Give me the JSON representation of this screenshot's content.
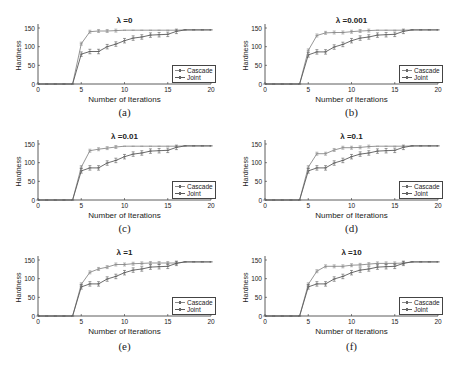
{
  "figure": {
    "panels": [
      {
        "id": "a",
        "title": "λ =0",
        "caption": "(a)"
      },
      {
        "id": "b",
        "title": "λ =0.001",
        "caption": "(b)"
      },
      {
        "id": "c",
        "title": "λ =0.01",
        "caption": "(c)"
      },
      {
        "id": "d",
        "title": "λ =0.1",
        "caption": "(d)"
      },
      {
        "id": "e",
        "title": "λ =1",
        "caption": "(e)"
      },
      {
        "id": "f",
        "title": "λ =10",
        "caption": "(f)"
      }
    ],
    "xlabel": "Number of Iterations",
    "ylabel": "Hardness",
    "legend": [
      "Cascade",
      "Joint"
    ],
    "xticks": [
      "0",
      "5",
      "10",
      "15",
      "20"
    ],
    "yticks": [
      "0",
      "50",
      "100",
      "150"
    ],
    "colors": {
      "cascade": "#8a8a8a",
      "joint": "#5a5a5a",
      "axis": "#333333"
    }
  },
  "chart_data": [
    {
      "type": "line",
      "title": "λ =0",
      "caption": "(a)",
      "xlabel": "Number of Iterations",
      "ylabel": "Hardness",
      "xlim": [
        0,
        20
      ],
      "ylim": [
        0,
        155
      ],
      "legend_position": "lower right",
      "grid": false,
      "x": [
        1,
        2,
        3,
        4,
        5,
        6,
        7,
        8,
        9,
        10,
        11,
        12,
        13,
        14,
        15,
        16,
        17,
        18,
        19,
        20
      ],
      "series": [
        {
          "name": "Cascade",
          "values": [
            0,
            0,
            0,
            0,
            108,
            140,
            142,
            142,
            143,
            144,
            144,
            144,
            144,
            144,
            144,
            144,
            145,
            145,
            145,
            145
          ]
        },
        {
          "name": "Joint",
          "values": [
            0,
            0,
            0,
            0,
            80,
            87,
            87,
            100,
            107,
            116,
            123,
            126,
            131,
            132,
            133,
            141,
            145,
            145,
            145,
            145
          ]
        }
      ]
    },
    {
      "type": "line",
      "title": "λ =0.001",
      "caption": "(b)",
      "xlabel": "Number of Iterations",
      "ylabel": "Hardness",
      "xlim": [
        0,
        20
      ],
      "ylim": [
        0,
        155
      ],
      "legend_position": "lower right",
      "grid": false,
      "x": [
        1,
        2,
        3,
        4,
        5,
        6,
        7,
        8,
        9,
        10,
        11,
        12,
        13,
        14,
        15,
        16,
        17,
        18,
        19,
        20
      ],
      "series": [
        {
          "name": "Cascade",
          "values": [
            0,
            0,
            0,
            0,
            90,
            130,
            137,
            138,
            138,
            140,
            142,
            143,
            144,
            144,
            144,
            144,
            145,
            145,
            145,
            145
          ]
        },
        {
          "name": "Joint",
          "values": [
            0,
            0,
            0,
            0,
            78,
            86,
            86,
            99,
            106,
            116,
            123,
            126,
            131,
            132,
            133,
            141,
            145,
            145,
            145,
            145
          ]
        }
      ]
    },
    {
      "type": "line",
      "title": "λ =0.01",
      "caption": "(c)",
      "xlabel": "Number of Iterations",
      "ylabel": "Hardness",
      "xlim": [
        0,
        20
      ],
      "ylim": [
        0,
        155
      ],
      "legend_position": "lower right",
      "grid": false,
      "x": [
        1,
        2,
        3,
        4,
        5,
        6,
        7,
        8,
        9,
        10,
        11,
        12,
        13,
        14,
        15,
        16,
        17,
        18,
        19,
        20
      ],
      "series": [
        {
          "name": "Cascade",
          "values": [
            0,
            0,
            0,
            0,
            88,
            132,
            136,
            139,
            142,
            144,
            144,
            144,
            144,
            144,
            144,
            144,
            145,
            145,
            145,
            145
          ]
        },
        {
          "name": "Joint",
          "values": [
            0,
            0,
            0,
            0,
            78,
            86,
            86,
            99,
            106,
            116,
            123,
            126,
            131,
            132,
            133,
            141,
            145,
            145,
            145,
            145
          ]
        }
      ]
    },
    {
      "type": "line",
      "title": "λ =0.1",
      "caption": "(d)",
      "xlabel": "Number of Iterations",
      "ylabel": "Hardness",
      "xlim": [
        0,
        20
      ],
      "ylim": [
        0,
        155
      ],
      "legend_position": "lower right",
      "grid": false,
      "x": [
        1,
        2,
        3,
        4,
        5,
        6,
        7,
        8,
        9,
        10,
        11,
        12,
        13,
        14,
        15,
        16,
        17,
        18,
        19,
        20
      ],
      "series": [
        {
          "name": "Cascade",
          "values": [
            0,
            0,
            0,
            0,
            88,
            124,
            124,
            134,
            140,
            140,
            141,
            143,
            144,
            144,
            144,
            144,
            145,
            145,
            145,
            145
          ]
        },
        {
          "name": "Joint",
          "values": [
            0,
            0,
            0,
            0,
            78,
            86,
            86,
            99,
            106,
            116,
            123,
            126,
            131,
            132,
            133,
            141,
            145,
            145,
            145,
            145
          ]
        }
      ]
    },
    {
      "type": "line",
      "title": "λ =1",
      "caption": "(e)",
      "xlabel": "Number of Iterations",
      "ylabel": "Hardness",
      "xlim": [
        0,
        20
      ],
      "ylim": [
        0,
        155
      ],
      "legend_position": "lower right",
      "grid": false,
      "x": [
        1,
        2,
        3,
        4,
        5,
        6,
        7,
        8,
        9,
        10,
        11,
        12,
        13,
        14,
        15,
        16,
        17,
        18,
        19,
        20
      ],
      "series": [
        {
          "name": "Cascade",
          "values": [
            0,
            0,
            0,
            0,
            85,
            117,
            126,
            131,
            138,
            138,
            140,
            141,
            142,
            142,
            142,
            142,
            145,
            145,
            145,
            145
          ]
        },
        {
          "name": "Joint",
          "values": [
            0,
            0,
            0,
            0,
            78,
            86,
            86,
            99,
            106,
            116,
            123,
            126,
            131,
            132,
            133,
            141,
            145,
            145,
            145,
            145
          ]
        }
      ]
    },
    {
      "type": "line",
      "title": "λ =10",
      "caption": "(f)",
      "xlabel": "Number of Iterations",
      "ylabel": "Hardness",
      "xlim": [
        0,
        20
      ],
      "ylim": [
        0,
        155
      ],
      "legend_position": "lower right",
      "grid": false,
      "x": [
        1,
        2,
        3,
        4,
        5,
        6,
        7,
        8,
        9,
        10,
        11,
        12,
        13,
        14,
        15,
        16,
        17,
        18,
        19,
        20
      ],
      "series": [
        {
          "name": "Cascade",
          "values": [
            0,
            0,
            0,
            0,
            85,
            120,
            133,
            133,
            133,
            136,
            137,
            139,
            141,
            141,
            141,
            142,
            145,
            145,
            145,
            145
          ]
        },
        {
          "name": "Joint",
          "values": [
            0,
            0,
            0,
            0,
            78,
            86,
            86,
            99,
            106,
            116,
            123,
            126,
            131,
            132,
            133,
            141,
            145,
            145,
            145,
            145
          ]
        }
      ]
    }
  ]
}
